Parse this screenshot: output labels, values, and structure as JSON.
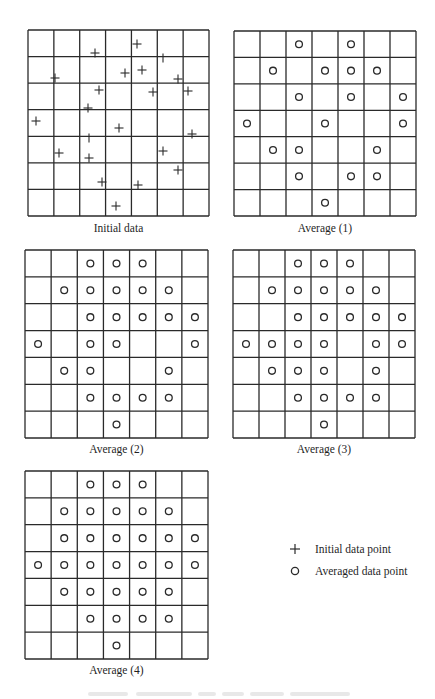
{
  "figure": {
    "grid": {
      "rows": 7,
      "cols": 7
    },
    "colors": {
      "line": "#2a2a2a",
      "marker": "#2a2a2a",
      "background": "#ffffff",
      "caption_faded": "#9a9a9a"
    }
  },
  "panels": [
    {
      "id": "initial",
      "label": "Initial data",
      "box": {
        "x": 28,
        "y": 30,
        "w": 181,
        "h": 186
      },
      "label_y": 222,
      "marker": "plus",
      "points_px": [
        [
          137,
          44
        ],
        [
          95,
          53
        ],
        [
          163,
          58,
          "tick"
        ],
        [
          125,
          73
        ],
        [
          142,
          70
        ],
        [
          55,
          78
        ],
        [
          178,
          79
        ],
        [
          99,
          90
        ],
        [
          153,
          92
        ],
        [
          188,
          91
        ],
        [
          88,
          108
        ],
        [
          36,
          121
        ],
        [
          119,
          128
        ],
        [
          192,
          134
        ],
        [
          89,
          138,
          "tick"
        ],
        [
          59,
          153
        ],
        [
          163,
          151
        ],
        [
          89,
          158
        ],
        [
          178,
          170
        ],
        [
          102,
          182
        ],
        [
          138,
          185
        ],
        [
          116,
          206
        ]
      ]
    },
    {
      "id": "average-1",
      "label": "Average (1)",
      "box": {
        "x": 234,
        "y": 31,
        "w": 182,
        "h": 185
      },
      "label_y": 222,
      "marker": "circle",
      "cells": [
        [
          0,
          2
        ],
        [
          0,
          4
        ],
        [
          1,
          1
        ],
        [
          1,
          3
        ],
        [
          1,
          4
        ],
        [
          1,
          5
        ],
        [
          2,
          2
        ],
        [
          2,
          4
        ],
        [
          2,
          6
        ],
        [
          3,
          0
        ],
        [
          3,
          3
        ],
        [
          3,
          6
        ],
        [
          4,
          1
        ],
        [
          4,
          2
        ],
        [
          4,
          5
        ],
        [
          5,
          2
        ],
        [
          5,
          4
        ],
        [
          5,
          5
        ],
        [
          6,
          3
        ]
      ]
    },
    {
      "id": "average-2",
      "label": "Average (2)",
      "box": {
        "x": 25,
        "y": 250,
        "w": 183,
        "h": 188
      },
      "label_y": 443,
      "marker": "circle",
      "cells": [
        [
          0,
          2
        ],
        [
          0,
          3
        ],
        [
          0,
          4
        ],
        [
          1,
          1
        ],
        [
          1,
          2
        ],
        [
          1,
          3
        ],
        [
          1,
          4
        ],
        [
          1,
          5
        ],
        [
          2,
          2
        ],
        [
          2,
          3
        ],
        [
          2,
          4
        ],
        [
          2,
          5
        ],
        [
          2,
          6
        ],
        [
          3,
          0
        ],
        [
          3,
          2
        ],
        [
          3,
          3
        ],
        [
          3,
          6
        ],
        [
          4,
          1
        ],
        [
          4,
          2
        ],
        [
          4,
          5
        ],
        [
          5,
          2
        ],
        [
          5,
          3
        ],
        [
          5,
          4
        ],
        [
          5,
          5
        ],
        [
          6,
          3
        ]
      ]
    },
    {
      "id": "average-3",
      "label": "Average (3)",
      "box": {
        "x": 233,
        "y": 250,
        "w": 182,
        "h": 188
      },
      "label_y": 443,
      "marker": "circle",
      "cells": [
        [
          0,
          2
        ],
        [
          0,
          3
        ],
        [
          0,
          4
        ],
        [
          1,
          1
        ],
        [
          1,
          2
        ],
        [
          1,
          3
        ],
        [
          1,
          4
        ],
        [
          1,
          5
        ],
        [
          2,
          2
        ],
        [
          2,
          3
        ],
        [
          2,
          4
        ],
        [
          2,
          5
        ],
        [
          2,
          6
        ],
        [
          3,
          0
        ],
        [
          3,
          1
        ],
        [
          3,
          2
        ],
        [
          3,
          3
        ],
        [
          3,
          5
        ],
        [
          3,
          6
        ],
        [
          4,
          1
        ],
        [
          4,
          2
        ],
        [
          4,
          3
        ],
        [
          4,
          5
        ],
        [
          5,
          2
        ],
        [
          5,
          3
        ],
        [
          5,
          4
        ],
        [
          5,
          5
        ],
        [
          6,
          3
        ]
      ]
    },
    {
      "id": "average-4",
      "label": "Average (4)",
      "box": {
        "x": 25,
        "y": 471,
        "w": 183,
        "h": 188
      },
      "label_y": 664,
      "marker": "circle",
      "cells": [
        [
          0,
          2
        ],
        [
          0,
          3
        ],
        [
          0,
          4
        ],
        [
          1,
          1
        ],
        [
          1,
          2
        ],
        [
          1,
          3
        ],
        [
          1,
          4
        ],
        [
          1,
          5
        ],
        [
          2,
          1
        ],
        [
          2,
          2
        ],
        [
          2,
          3
        ],
        [
          2,
          4
        ],
        [
          2,
          5
        ],
        [
          2,
          6
        ],
        [
          3,
          0
        ],
        [
          3,
          1
        ],
        [
          3,
          2
        ],
        [
          3,
          3
        ],
        [
          3,
          4
        ],
        [
          3,
          5
        ],
        [
          3,
          6
        ],
        [
          4,
          1
        ],
        [
          4,
          2
        ],
        [
          4,
          3
        ],
        [
          4,
          4
        ],
        [
          4,
          5
        ],
        [
          5,
          2
        ],
        [
          5,
          3
        ],
        [
          5,
          4
        ],
        [
          5,
          5
        ],
        [
          6,
          3
        ]
      ]
    }
  ],
  "legend": {
    "items": [
      {
        "symbol": "plus",
        "label": "Initial data point"
      },
      {
        "symbol": "circle",
        "label": "Averaged data point"
      }
    ]
  },
  "caption": {
    "legible": false,
    "text": ""
  }
}
